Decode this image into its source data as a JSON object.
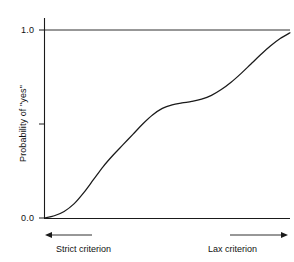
{
  "figure": {
    "name": "psychometric-function-plot",
    "background_color": "#ffffff",
    "ink_color": "#1a1a1a"
  },
  "chart_data": {
    "type": "line",
    "title": "",
    "xlabel": "",
    "ylabel": "Probability of \"yes\"",
    "xlim": [
      0,
      1
    ],
    "ylim": [
      0,
      1
    ],
    "grid": false,
    "legend": null,
    "y_ticks": [
      {
        "value": 0.0,
        "label": "0.0"
      },
      {
        "value": 0.5,
        "label": ""
      },
      {
        "value": 1.0,
        "label": "1.0"
      }
    ],
    "y_tick_labels": [
      "0.0",
      "1.0"
    ],
    "x_ticks": [],
    "x_tick_labels": [],
    "reference_line_y": 1.0,
    "annotations": [
      {
        "name": "strict-criterion",
        "text": "Strict criterion",
        "arrow": "left"
      },
      {
        "name": "lax-criterion",
        "text": "Lax criterion",
        "arrow": "right"
      }
    ],
    "series": [
      {
        "name": "psychometric curve",
        "color": "#1a1a1a",
        "x": [
          0.0,
          0.04,
          0.08,
          0.12,
          0.16,
          0.2,
          0.24,
          0.28,
          0.32,
          0.36,
          0.4,
          0.44,
          0.48,
          0.52,
          0.56,
          0.6,
          0.64,
          0.68,
          0.72,
          0.76,
          0.8,
          0.84,
          0.88,
          0.92,
          0.96,
          1.0
        ],
        "y": [
          0.0,
          0.012,
          0.035,
          0.075,
          0.135,
          0.205,
          0.275,
          0.335,
          0.39,
          0.445,
          0.5,
          0.548,
          0.583,
          0.602,
          0.612,
          0.62,
          0.632,
          0.652,
          0.683,
          0.722,
          0.768,
          0.818,
          0.868,
          0.915,
          0.955,
          0.985
        ]
      }
    ]
  },
  "labels": {
    "y_top": "1.0",
    "y_bottom": "0.0",
    "y_axis_title": "Probability of \"yes\"",
    "strict_criterion": "Strict criterion",
    "lax_criterion": "Lax criterion"
  }
}
